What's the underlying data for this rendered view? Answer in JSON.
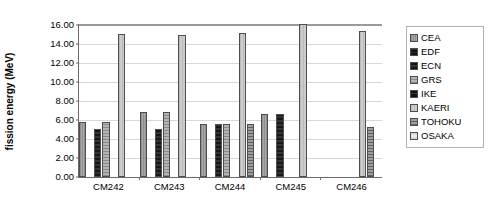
{
  "chart_data": {
    "type": "bar",
    "title": "",
    "subtitle": "",
    "xlabel": "",
    "ylabel": "fission energy (MeV)",
    "ylim": [
      0,
      16
    ],
    "ytick_step": 2,
    "ytick_labels": [
      "16.00",
      "14.00",
      "12.00",
      "10.00",
      "8.00",
      "6.00",
      "4.00",
      "2.00",
      "0.00"
    ],
    "ytick_values": [
      16,
      14,
      12,
      10,
      8,
      6,
      4,
      2,
      0
    ],
    "grid": true,
    "grid_axis": "y",
    "legend_position": "right",
    "categories": [
      "CM242",
      "CM243",
      "CM244",
      "CM245",
      "CM246"
    ],
    "series": [
      {
        "name": "CEA",
        "pattern": "f-cea",
        "values": [
          5.7,
          6.8,
          5.55,
          6.5,
          null
        ]
      },
      {
        "name": "EDF",
        "pattern": "f-edf",
        "values": [
          null,
          null,
          null,
          null,
          null
        ]
      },
      {
        "name": "ECN",
        "pattern": "f-ecn",
        "values": [
          5.0,
          5.0,
          5.55,
          6.5,
          null
        ]
      },
      {
        "name": "GRS",
        "pattern": "f-grs",
        "values": [
          5.7,
          6.8,
          5.55,
          null,
          null
        ]
      },
      {
        "name": "IKE",
        "pattern": "f-ike",
        "values": [
          null,
          null,
          null,
          null,
          null
        ]
      },
      {
        "name": "KAERI",
        "pattern": "f-kaeri",
        "values": [
          14.85,
          14.75,
          15.0,
          15.9,
          15.15
        ]
      },
      {
        "name": "TOHOKU",
        "pattern": "f-tohoku",
        "values": [
          null,
          null,
          5.55,
          null,
          5.2
        ]
      },
      {
        "name": "OSAKA",
        "pattern": "f-osaka",
        "values": [
          null,
          null,
          null,
          null,
          null
        ]
      }
    ]
  },
  "legend": {
    "items": [
      {
        "label": "CEA"
      },
      {
        "label": "EDF"
      },
      {
        "label": "ECN"
      },
      {
        "label": "GRS"
      },
      {
        "label": "IKE"
      },
      {
        "label": "KAERI"
      },
      {
        "label": "TOHOKU"
      },
      {
        "label": "OSAKA"
      }
    ]
  },
  "colors": {
    "axis": "#6b6b6b",
    "gridline": "#d7d7d7",
    "bar_outline": "#4d4d4d",
    "background": "#ffffff",
    "text": "#000000"
  }
}
